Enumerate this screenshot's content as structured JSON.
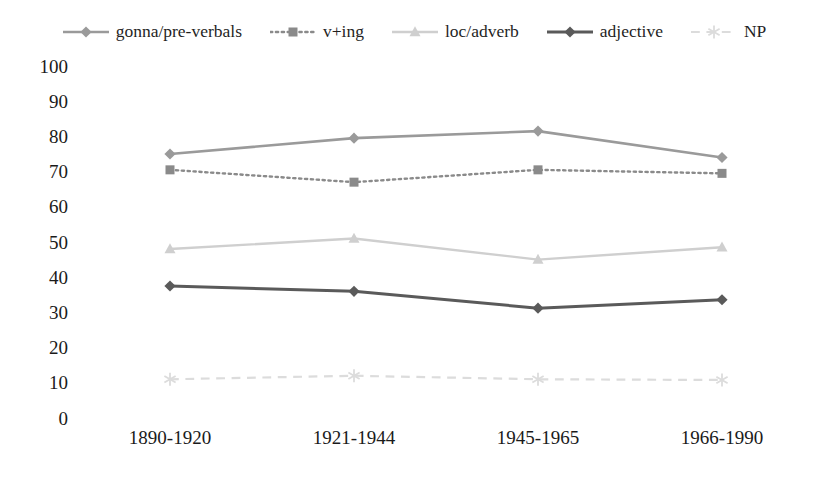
{
  "chart_data": {
    "type": "line",
    "title": "",
    "xlabel": "",
    "ylabel": "",
    "categories": [
      "1890-1920",
      "1921-1944",
      "1945-1965",
      "1966-1990"
    ],
    "ylim": [
      0,
      100
    ],
    "ytick_step": 10,
    "yticks": [
      "100",
      "90",
      "80",
      "70",
      "60",
      "50",
      "40",
      "30",
      "20",
      "10",
      "0"
    ],
    "grid": false,
    "legend_position": "top",
    "series": [
      {
        "name": "gonna/pre-verbals",
        "values": [
          75,
          79.5,
          81.5,
          74
        ],
        "color": "#9a9a9a",
        "line_style": "solid",
        "marker": "diamond",
        "line_width": 2.6
      },
      {
        "name": "v+ing",
        "values": [
          70.5,
          67,
          70.5,
          69.5
        ],
        "color": "#8a8a8a",
        "line_style": "dotted",
        "marker": "square",
        "line_width": 2.4
      },
      {
        "name": "loc/adverb",
        "values": [
          48,
          51,
          45,
          48.5
        ],
        "color": "#cfcfcf",
        "line_style": "solid",
        "marker": "triangle",
        "line_width": 2.4
      },
      {
        "name": "adjective",
        "values": [
          37.5,
          36,
          31.2,
          33.6
        ],
        "color": "#5a5a5a",
        "line_style": "solid",
        "marker": "diamond",
        "line_width": 3
      },
      {
        "name": "NP",
        "values": [
          11,
          12,
          11,
          10.8
        ],
        "color": "#dcdcdc",
        "line_style": "dashed",
        "marker": "asterisk",
        "line_width": 2.2
      }
    ]
  }
}
